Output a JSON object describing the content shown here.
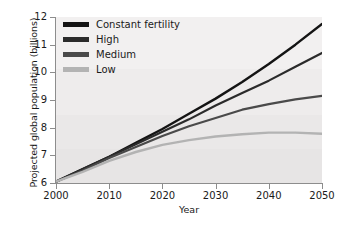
{
  "chart_data": {
    "type": "line",
    "title": "",
    "xlabel": "Year",
    "ylabel": "Projected global population (billions)",
    "xlim": [
      2000,
      2050
    ],
    "ylim": [
      6,
      12
    ],
    "grid": false,
    "legend_position": "upper-left inside plot",
    "x_ticks": [
      "2000",
      "2010",
      "2020",
      "2030",
      "2040",
      "2050"
    ],
    "y_ticks": [
      "6",
      "7",
      "8",
      "9",
      "10",
      "11",
      "12"
    ],
    "x": [
      2000,
      2005,
      2010,
      2015,
      2020,
      2025,
      2030,
      2035,
      2040,
      2045,
      2050
    ],
    "series": [
      {
        "name": "Constant fertility",
        "color": "#141414",
        "values": [
          6.05,
          6.5,
          6.95,
          7.45,
          7.95,
          8.5,
          9.05,
          9.65,
          10.3,
          11.0,
          11.75
        ]
      },
      {
        "name": "High",
        "color": "#2b2b2b",
        "values": [
          6.05,
          6.5,
          6.95,
          7.4,
          7.85,
          8.3,
          8.8,
          9.25,
          9.7,
          10.2,
          10.7
        ]
      },
      {
        "name": "Medium",
        "color": "#4a4a4a",
        "values": [
          6.05,
          6.45,
          6.9,
          7.3,
          7.7,
          8.05,
          8.35,
          8.65,
          8.85,
          9.02,
          9.15
        ]
      },
      {
        "name": "Low",
        "color": "#b3b3b3",
        "values": [
          6.05,
          6.4,
          6.8,
          7.12,
          7.38,
          7.55,
          7.68,
          7.76,
          7.82,
          7.82,
          7.78
        ]
      }
    ]
  }
}
